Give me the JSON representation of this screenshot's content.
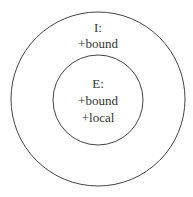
{
  "diagram": {
    "outer": {
      "label": "I:",
      "features": [
        "+bound"
      ]
    },
    "inner": {
      "label": "E:",
      "features": [
        "+bound",
        "+local"
      ]
    },
    "colors": {
      "stroke": "#444444",
      "text": "#333333",
      "background": "#ffffff"
    }
  }
}
